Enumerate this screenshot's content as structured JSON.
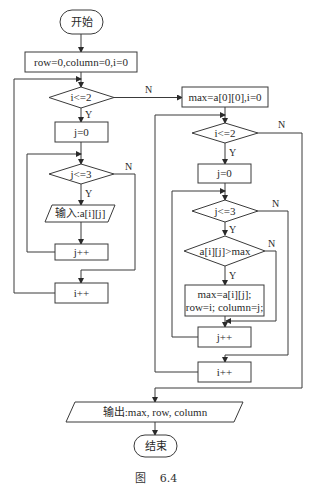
{
  "diagram": {
    "type": "flowchart",
    "caption": "图    6.4",
    "nodes": {
      "start": "开始",
      "init": "row=0,column=0,i=0",
      "cond_i_left": "i<=2",
      "j0_left": "j=0",
      "cond_j_left": "j<=3",
      "input": "输入:a[i][j]",
      "jpp_left": "j++",
      "ipp_left": "i++",
      "init_max": "max=a[0][0],i=0",
      "cond_i_right": "i<=2",
      "j0_right": "j=0",
      "cond_j_right": "j<=3",
      "cond_max": "a[i][j]>max",
      "assign_line1": "max=a[i][j];",
      "assign_line2": "row=i; column=j;",
      "jpp_right": "j++",
      "ipp_right": "i++",
      "output": "输出:max, row, column",
      "end": "结束"
    },
    "labels": {
      "yes": "Y",
      "no": "N"
    },
    "edges": [
      {
        "from": "start",
        "to": "init"
      },
      {
        "from": "init",
        "to": "cond_i_left"
      },
      {
        "from": "cond_i_left",
        "to": "j0_left",
        "label": "Y"
      },
      {
        "from": "cond_i_left",
        "to": "init_max",
        "label": "N"
      },
      {
        "from": "j0_left",
        "to": "cond_j_left"
      },
      {
        "from": "cond_j_left",
        "to": "input",
        "label": "Y"
      },
      {
        "from": "cond_j_left",
        "to": "ipp_left",
        "label": "N"
      },
      {
        "from": "input",
        "to": "jpp_left"
      },
      {
        "from": "jpp_left",
        "to": "cond_j_left"
      },
      {
        "from": "ipp_left",
        "to": "cond_i_left"
      },
      {
        "from": "init_max",
        "to": "cond_i_right"
      },
      {
        "from": "cond_i_right",
        "to": "j0_right",
        "label": "Y"
      },
      {
        "from": "cond_i_right",
        "to": "output",
        "label": "N"
      },
      {
        "from": "j0_right",
        "to": "cond_j_right"
      },
      {
        "from": "cond_j_right",
        "to": "cond_max",
        "label": "Y"
      },
      {
        "from": "cond_j_right",
        "to": "ipp_right",
        "label": "N"
      },
      {
        "from": "cond_max",
        "to": "assign",
        "label": "Y"
      },
      {
        "from": "cond_max",
        "to": "jpp_right",
        "label": "N"
      },
      {
        "from": "assign",
        "to": "jpp_right"
      },
      {
        "from": "jpp_right",
        "to": "cond_j_right"
      },
      {
        "from": "ipp_right",
        "to": "cond_i_right"
      },
      {
        "from": "output",
        "to": "end"
      }
    ]
  }
}
